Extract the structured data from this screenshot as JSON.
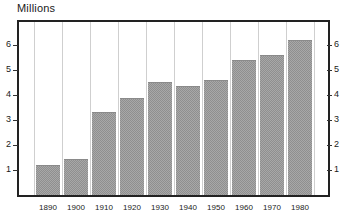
{
  "chart_data": {
    "type": "bar",
    "title": "Millions",
    "xlabel": "",
    "ylabel": "Millions",
    "categories": [
      "1890",
      "1900",
      "1910",
      "1920",
      "1930",
      "1940",
      "1950",
      "1960",
      "1970",
      "1980"
    ],
    "values": [
      1.2,
      1.45,
      3.3,
      3.85,
      4.5,
      4.35,
      4.6,
      5.4,
      5.6,
      6.2
    ],
    "ylim": [
      0,
      6.9
    ],
    "yticks": [
      1,
      2,
      3,
      4,
      5,
      6
    ],
    "ytick_labels_left": [
      "1",
      "2",
      "3",
      "4",
      "5",
      "6"
    ],
    "ytick_labels_right": [
      "1",
      "2",
      "3",
      "4",
      "5",
      "6"
    ],
    "grid": "vertical-separators-only",
    "legend": "none",
    "bar_fill": "#a8a8a8",
    "bar_pattern": "checkerboard-dither",
    "frame_color": "#222222",
    "gridline_color": "#cfcfcf",
    "background": "#ffffff",
    "text_color": "#1a1a1a"
  }
}
